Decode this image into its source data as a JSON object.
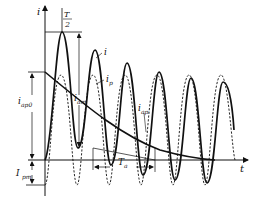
{
  "diagram": {
    "type": "short-circuit current waveform",
    "labels": {
      "y_axis": "i",
      "x_axis": "t",
      "half_period_num": "T",
      "half_period_den": "2",
      "total_current": "i",
      "periodic_component": "i",
      "periodic_component_sub": "p",
      "aperiodic_component": "i",
      "aperiodic_component_sub": "ap",
      "aperiodic_initial": "i",
      "aperiodic_initial_sub": "ap0",
      "amplitude": "i",
      "amplitude_sub": "am",
      "periodic_peak": "I",
      "periodic_peak_sub": "pm",
      "time_constant": "T",
      "time_constant_sub": "a"
    },
    "colors": {
      "stroke": "#111111",
      "background": "#ffffff"
    }
  }
}
